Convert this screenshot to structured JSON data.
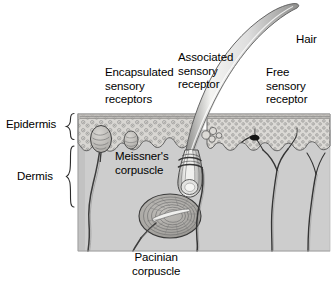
{
  "figure": {
    "kind": "anatomical-cross-section-diagram"
  },
  "layers": {
    "epidermis_label": "Epidermis",
    "dermis_label": "Dermis"
  },
  "callouts": {
    "encapsulated": "Encapsulated\nsensory\nreceptors",
    "associated": "Associated\nsensory\nreceptor",
    "free": "Free\nsensory\nreceptor",
    "hair": "Hair",
    "meissner": "Meissner's\ncorpuscle",
    "pacinian": "Pacinian\ncorpuscle"
  },
  "colors": {
    "background": "#ffffff",
    "dermis_fill": "#cdcdcd",
    "epidermis_fill": "#d6d4d0",
    "epidermis_stipple": "#8a8a8a",
    "ink": "#000000",
    "line": "#4a4a4a",
    "hair_shaft": "#e8e8e6",
    "corpuscle_fill": "#c6c4c0"
  },
  "geometry": {
    "block_left": 78,
    "block_right": 330,
    "epidermis_top": 112,
    "epidermis_bottom": 145,
    "dermis_bottom": 251
  }
}
